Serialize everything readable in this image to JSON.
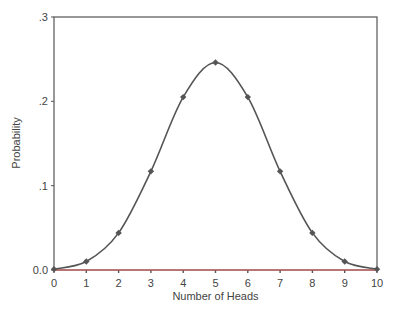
{
  "chart_data": {
    "type": "line",
    "title": "",
    "xlabel": "Number of Heads",
    "ylabel": "Probability",
    "x": [
      0,
      1,
      2,
      3,
      4,
      5,
      6,
      7,
      8,
      9,
      10
    ],
    "series": [
      {
        "name": "Binomial(10, 0.5)",
        "values": [
          0.001,
          0.01,
          0.044,
          0.117,
          0.205,
          0.246,
          0.205,
          0.117,
          0.044,
          0.01,
          0.001
        ]
      }
    ],
    "xlim": [
      0,
      10
    ],
    "ylim": [
      0,
      0.3
    ],
    "x_ticks": [
      "0",
      "1",
      "2",
      "3",
      "4",
      "5",
      "6",
      "7",
      "8",
      "9",
      "10"
    ],
    "y_ticks": [
      "0.0",
      ".1",
      ".2",
      ".3"
    ],
    "grid": false,
    "legend": "none",
    "line_color": "#555555",
    "marker": "diamond",
    "baseline_color": "#d9534f"
  }
}
